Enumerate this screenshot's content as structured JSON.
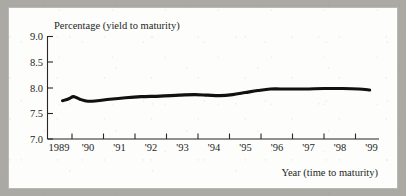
{
  "figure": {
    "background_color": "#aaa9a4",
    "panel_color": "#fdfdfb",
    "line_color": "#121010"
  },
  "chart_data": {
    "type": "line",
    "title": "",
    "ylabel": "Percentage (yield to maturity)",
    "xlabel": "Year (time to maturity)",
    "ylim": [
      7.0,
      9.0
    ],
    "xlim": [
      1989,
      1999.6
    ],
    "grid": false,
    "legend": null,
    "y_ticks": [
      "9.0",
      "8.5",
      "8.0",
      "7.5",
      "7.0"
    ],
    "y_tick_values": [
      9.0,
      8.5,
      8.0,
      7.5,
      7.0
    ],
    "x_ticks": [
      "1989",
      "'90",
      "'91",
      "'92",
      "'93",
      "'94",
      "'95",
      "'96",
      "'97",
      "'98",
      "'99"
    ],
    "x_tick_values": [
      1989,
      1990,
      1991,
      1992,
      1993,
      1994,
      1995,
      1996,
      1997,
      1998,
      1999
    ],
    "series": [
      {
        "name": "Yield to maturity",
        "x": [
          1989.7,
          1989.9,
          1990.05,
          1990.25,
          1990.5,
          1990.8,
          1991.2,
          1991.7,
          1992.2,
          1992.8,
          1993.4,
          1993.9,
          1994.3,
          1994.7,
          1995.1,
          1995.5,
          1995.9,
          1996.3,
          1996.8,
          1997.4,
          1998.0,
          1998.6,
          1999.1,
          1999.45
        ],
        "y": [
          7.75,
          7.79,
          7.83,
          7.78,
          7.74,
          7.75,
          7.78,
          7.81,
          7.83,
          7.84,
          7.86,
          7.87,
          7.86,
          7.85,
          7.87,
          7.91,
          7.95,
          7.98,
          7.98,
          7.98,
          7.99,
          7.99,
          7.98,
          7.96
        ]
      }
    ]
  }
}
